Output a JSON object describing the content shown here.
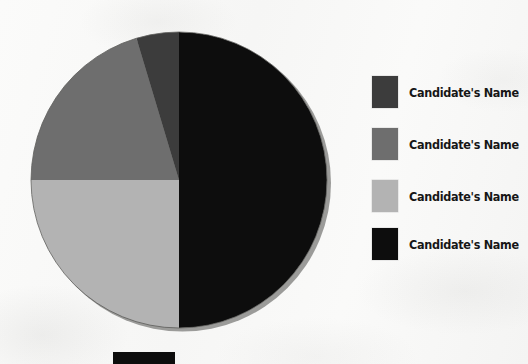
{
  "figure": {
    "background_color": "#f8f8f7",
    "media": "scanned-paper"
  },
  "chart_data": {
    "type": "pie",
    "title": "",
    "subtitle": "",
    "xlabel": "",
    "ylabel": "",
    "grid": false,
    "legend_position": "right",
    "start_angle_deg": 0,
    "direction": "clockwise",
    "center": {
      "x": 179,
      "y": 180
    },
    "radius": 148,
    "categories": [
      "Candidate's Name",
      "Candidate's Name",
      "Candidate's Name",
      "Candidate's Name"
    ],
    "values": [
      50.0,
      25.0,
      20.3,
      4.7
    ],
    "slices": [
      {
        "label": "Candidate's Name",
        "value": 50.0,
        "color": "#0d0d0d",
        "start_deg": 0,
        "end_deg": 180,
        "swatch_order": 4
      },
      {
        "label": "Candidate's Name",
        "value": 25.0,
        "color": "#b3b3b3",
        "start_deg": 180,
        "end_deg": 270,
        "swatch_order": 3
      },
      {
        "label": "Candidate's Name",
        "value": 20.3,
        "color": "#6e6e6e",
        "start_deg": 270,
        "end_deg": 343,
        "swatch_order": 2
      },
      {
        "label": "Candidate's Name",
        "value": 4.7,
        "color": "#3c3c3c",
        "start_deg": 343,
        "end_deg": 360,
        "swatch_order": 1
      }
    ]
  },
  "legend": {
    "items": [
      {
        "label": "Candidate's Name",
        "color": "#3c3c3c",
        "top": 6
      },
      {
        "label": "Candidate's Name",
        "color": "#6e6e6e",
        "top": 58
      },
      {
        "label": "Candidate's Name",
        "color": "#b3b3b3",
        "top": 110
      },
      {
        "label": "Candidate's Name",
        "color": "#0d0d0d",
        "top": 158
      }
    ]
  },
  "bottom_bar": {
    "color": "#0d0d0d",
    "note": ""
  }
}
